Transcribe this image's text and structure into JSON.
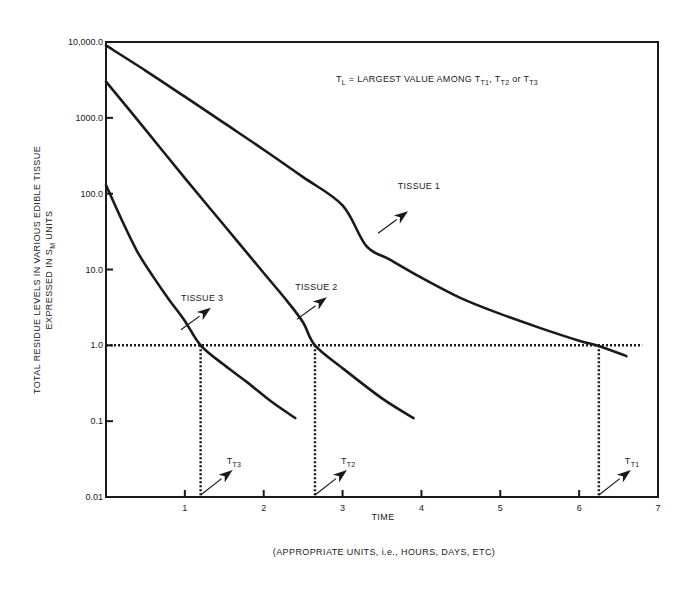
{
  "chart_data": {
    "type": "line",
    "title": "",
    "annotation": {
      "prefix": "T",
      "prefix_sub": "L",
      "text": " = LARGEST VALUE AMONG ",
      "items": [
        {
          "base": "T",
          "sub": "T1",
          "sep": ", "
        },
        {
          "base": "T",
          "sub": "T2",
          "sep": " or "
        },
        {
          "base": "T",
          "sub": "T3",
          "sep": ""
        }
      ]
    },
    "xlabel": "TIME",
    "xlabel_note": "(APPROPRIATE UNITS, i.e., HOURS, DAYS, ETC)",
    "ylabel_line1": "TOTAL RESIDUE LEVELS IN VARIOUS EDIBLE TISSUE",
    "ylabel_line2_prefix": "EXPRESSED IN S",
    "ylabel_line2_sub": "M",
    "ylabel_line2_suffix": " UNITS",
    "xlim": [
      0,
      7
    ],
    "ylim": [
      0.01,
      10000
    ],
    "yscale": "log",
    "grid": false,
    "x_ticks": [
      1,
      2,
      3,
      4,
      5,
      6,
      7
    ],
    "x_tick_labels": [
      "1",
      "2",
      "3",
      "4",
      "5",
      "6",
      "7"
    ],
    "y_ticks": [
      10000,
      1000,
      100,
      10,
      1,
      0.1,
      0.01
    ],
    "y_tick_labels": [
      "10,000.0",
      "1000.0",
      "100.0",
      "10.0",
      "1.0",
      "0.1",
      "0.01"
    ],
    "threshold": {
      "y": 1.0,
      "style": "dotted",
      "x_range": [
        0,
        6.8
      ]
    },
    "series": [
      {
        "name": "TISSUE 1",
        "x": [
          0,
          0.5,
          1,
          1.5,
          2,
          2.5,
          3,
          3.3,
          3.6,
          4,
          4.5,
          5,
          5.5,
          6,
          6.25,
          6.6
        ],
        "y": [
          9000,
          4200,
          1900,
          850,
          380,
          165,
          70,
          20.5,
          13.5,
          7.8,
          4.2,
          2.6,
          1.7,
          1.15,
          0.98,
          0.72
        ],
        "label_anchor": {
          "x": 3.45,
          "y": 30
        },
        "label_pos": {
          "x": 3.7,
          "y": 95
        }
      },
      {
        "name": "TISSUE 2",
        "x": [
          0,
          0.5,
          1,
          1.5,
          2,
          2.3,
          2.5,
          2.65,
          3,
          3.5,
          3.9
        ],
        "y": [
          3000,
          700,
          160,
          38,
          9,
          3.8,
          2.0,
          1.0,
          0.5,
          0.2,
          0.11
        ],
        "label_anchor": {
          "x": 2.42,
          "y": 2.2
        },
        "label_pos": {
          "x": 2.4,
          "y": 4.5
        }
      },
      {
        "name": "TISSUE 3",
        "x": [
          0,
          0.2,
          0.4,
          0.6,
          0.8,
          1,
          1.2,
          1.5,
          1.8,
          2.1,
          2.4
        ],
        "y": [
          130,
          45,
          17,
          8,
          4,
          2.1,
          1.0,
          0.55,
          0.32,
          0.18,
          0.11
        ],
        "label_anchor": {
          "x": 0.95,
          "y": 1.6
        },
        "label_pos": {
          "x": 0.95,
          "y": 3.2
        }
      }
    ],
    "markers": [
      {
        "label_base": "T",
        "label_sub": "T3",
        "x": 1.2
      },
      {
        "label_base": "T",
        "label_sub": "T2",
        "x": 2.65
      },
      {
        "label_base": "T",
        "label_sub": "T1",
        "x": 6.25
      }
    ]
  }
}
